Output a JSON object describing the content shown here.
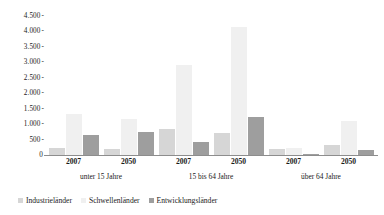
{
  "chart_data": {
    "type": "bar",
    "title": "",
    "subtitle": "",
    "xlabel": "",
    "ylabel": "",
    "ylim": [
      0,
      4500
    ],
    "ytick_step": 500,
    "ytick_labels": [
      "4.500",
      "4.000",
      "3.500",
      "3.000",
      "2.500",
      "2.000",
      "1.500",
      "1.000",
      "500",
      "0"
    ],
    "ytick_values": [
      4500,
      4000,
      3500,
      3000,
      2500,
      2000,
      1500,
      1000,
      500,
      0
    ],
    "grid": false,
    "legend_position": "bottom-left",
    "age_groups": [
      "unter 15 Jahre",
      "15 bis 64 Jahre",
      "über 64 Jahre"
    ],
    "years": [
      "2007",
      "2050",
      "2007",
      "2050",
      "2007",
      "2050"
    ],
    "categories": [
      "unter 15 Jahre 2007",
      "unter 15 Jahre 2050",
      "15 bis 64 Jahre 2007",
      "15 bis 64 Jahre 2050",
      "über 64 Jahre 2007",
      "über 64 Jahre 2050"
    ],
    "series": [
      {
        "name": "Industrieländer",
        "color": "#d6d6d6",
        "values": [
          215,
          195,
          830,
          720,
          200,
          320
        ]
      },
      {
        "name": "Schwellenländer",
        "color": "#f0f0f0",
        "values": [
          1330,
          1150,
          2900,
          4150,
          230,
          1100
        ]
      },
      {
        "name": "Entwicklungsländer",
        "color": "#9e9e9e",
        "values": [
          640,
          760,
          430,
          1240,
          40,
          170
        ]
      }
    ]
  },
  "legend": {
    "items": [
      {
        "label": "Industrieländer",
        "color": "#d6d6d6"
      },
      {
        "label": "Schwellenländer",
        "color": "#f0f0f0"
      },
      {
        "label": "Entwicklungsländer",
        "color": "#9e9e9e"
      }
    ]
  },
  "axis": {
    "tick_mark": "-"
  }
}
